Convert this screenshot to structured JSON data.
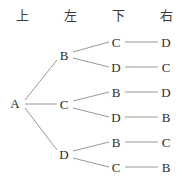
{
  "diagram": {
    "line_color": "#8c8c8c",
    "text_color": "#2b2b2b",
    "header_color": "#3a3a3a",
    "background": "#ffffff",
    "headers": [
      {
        "label": "上",
        "x": 22,
        "y": 16
      },
      {
        "label": "左",
        "x": 70,
        "y": 16
      },
      {
        "label": "下",
        "x": 118,
        "y": 16
      },
      {
        "label": "右",
        "x": 166,
        "y": 16
      }
    ],
    "nodes": [
      {
        "id": "root",
        "label": "A",
        "x": 15,
        "y": 104
      },
      {
        "id": "l1-b",
        "label": "B",
        "x": 64,
        "y": 56
      },
      {
        "id": "l1-c",
        "label": "C",
        "x": 64,
        "y": 105
      },
      {
        "id": "l1-d",
        "label": "D",
        "x": 64,
        "y": 155
      },
      {
        "id": "l2-1",
        "label": "C",
        "x": 116,
        "y": 43
      },
      {
        "id": "l2-2",
        "label": "D",
        "x": 116,
        "y": 68
      },
      {
        "id": "l2-3",
        "label": "B",
        "x": 116,
        "y": 93
      },
      {
        "id": "l2-4",
        "label": "D",
        "x": 116,
        "y": 118
      },
      {
        "id": "l2-5",
        "label": "B",
        "x": 116,
        "y": 143
      },
      {
        "id": "l2-6",
        "label": "C",
        "x": 116,
        "y": 168
      },
      {
        "id": "l3-1",
        "label": "D",
        "x": 166,
        "y": 43
      },
      {
        "id": "l3-2",
        "label": "C",
        "x": 166,
        "y": 68
      },
      {
        "id": "l3-3",
        "label": "D",
        "x": 166,
        "y": 93
      },
      {
        "id": "l3-4",
        "label": "B",
        "x": 166,
        "y": 118
      },
      {
        "id": "l3-5",
        "label": "C",
        "x": 166,
        "y": 143
      },
      {
        "id": "l3-6",
        "label": "B",
        "x": 166,
        "y": 168
      }
    ],
    "edges": [
      {
        "from": "root",
        "to": "l1-b",
        "x1": 25,
        "y1": 100,
        "x2": 57,
        "y2": 60
      },
      {
        "from": "root",
        "to": "l1-c",
        "x1": 25,
        "y1": 104,
        "x2": 57,
        "y2": 104
      },
      {
        "from": "root",
        "to": "l1-d",
        "x1": 25,
        "y1": 108,
        "x2": 57,
        "y2": 150
      },
      {
        "from": "l1-b",
        "to": "l2-1",
        "x1": 73,
        "y1": 52,
        "x2": 109,
        "y2": 42
      },
      {
        "from": "l1-b",
        "to": "l2-2",
        "x1": 73,
        "y1": 58,
        "x2": 109,
        "y2": 67
      },
      {
        "from": "l1-c",
        "to": "l2-3",
        "x1": 73,
        "y1": 101,
        "x2": 109,
        "y2": 92
      },
      {
        "from": "l1-c",
        "to": "l2-4",
        "x1": 73,
        "y1": 108,
        "x2": 109,
        "y2": 117
      },
      {
        "from": "l1-d",
        "to": "l2-5",
        "x1": 73,
        "y1": 151,
        "x2": 109,
        "y2": 142
      },
      {
        "from": "l1-d",
        "to": "l2-6",
        "x1": 73,
        "y1": 158,
        "x2": 109,
        "y2": 167
      },
      {
        "from": "l2-1",
        "to": "l3-1",
        "x1": 125,
        "y1": 42,
        "x2": 158,
        "y2": 42
      },
      {
        "from": "l2-2",
        "to": "l3-2",
        "x1": 125,
        "y1": 67,
        "x2": 158,
        "y2": 67
      },
      {
        "from": "l2-3",
        "to": "l3-3",
        "x1": 125,
        "y1": 92,
        "x2": 158,
        "y2": 92
      },
      {
        "from": "l2-4",
        "to": "l3-4",
        "x1": 125,
        "y1": 117,
        "x2": 158,
        "y2": 117
      },
      {
        "from": "l2-5",
        "to": "l3-5",
        "x1": 125,
        "y1": 142,
        "x2": 158,
        "y2": 142
      },
      {
        "from": "l2-6",
        "to": "l3-6",
        "x1": 125,
        "y1": 167,
        "x2": 158,
        "y2": 167
      }
    ],
    "branches": [
      {
        "path": [
          "A",
          "B",
          "C",
          "D"
        ]
      },
      {
        "path": [
          "A",
          "B",
          "D",
          "C"
        ]
      },
      {
        "path": [
          "A",
          "C",
          "B",
          "D"
        ]
      },
      {
        "path": [
          "A",
          "C",
          "D",
          "B"
        ]
      },
      {
        "path": [
          "A",
          "D",
          "B",
          "C"
        ]
      },
      {
        "path": [
          "A",
          "D",
          "C",
          "B"
        ]
      }
    ]
  }
}
